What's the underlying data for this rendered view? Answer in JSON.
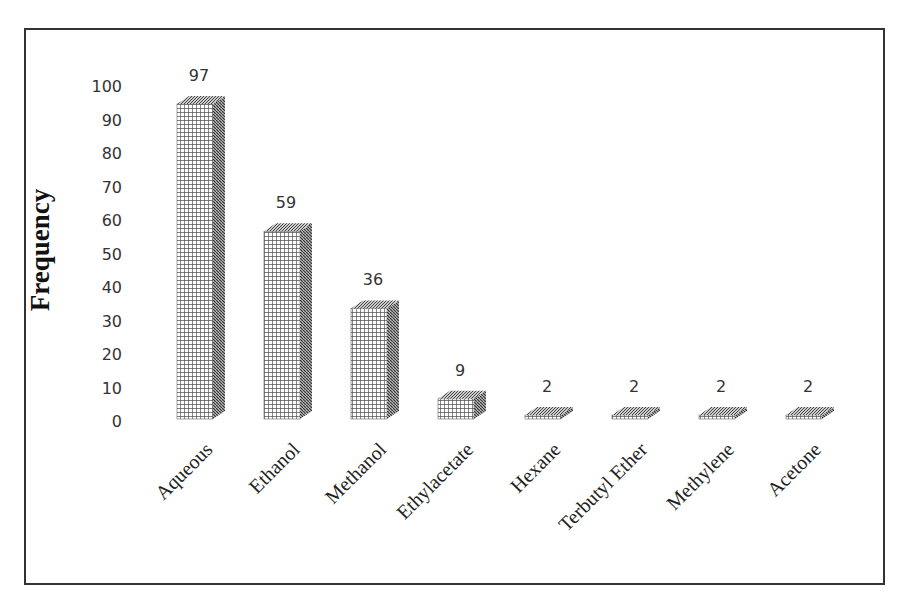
{
  "chart_data": {
    "type": "bar",
    "title": "",
    "xlabel": "",
    "ylabel": "Frequency",
    "ylim": [
      0,
      100
    ],
    "yticks": [
      0,
      10,
      20,
      30,
      40,
      50,
      60,
      70,
      80,
      90,
      100
    ],
    "categories": [
      "Aqueous",
      "Ethanol",
      "Methanol",
      "Ethylacetate",
      "Hexane",
      "Terbutyl Ether",
      "Methylene",
      "Acetone"
    ],
    "values": [
      97,
      59,
      36,
      9,
      2,
      2,
      2,
      2
    ],
    "data_labels": [
      "97",
      "59",
      "36",
      "9",
      "2",
      "2",
      "2",
      "2"
    ],
    "grid": false,
    "legend": "none",
    "style": "3d-column-crosshatch"
  },
  "axis": {
    "ylabel": "Frequency",
    "ticks": [
      "0",
      "10",
      "20",
      "30",
      "40",
      "50",
      "60",
      "70",
      "80",
      "90",
      "100"
    ]
  },
  "colors": {
    "bar_pattern": "#4a4a4a",
    "frame": "#333333",
    "text": "#333333"
  }
}
